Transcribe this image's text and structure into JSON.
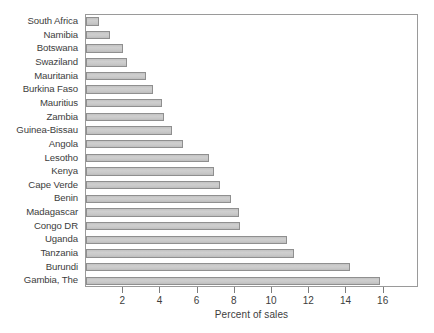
{
  "chart_data": {
    "type": "bar",
    "orientation": "horizontal",
    "title": "",
    "xlabel": "Percent of sales",
    "ylabel": "",
    "xlim": [
      0,
      17.9
    ],
    "xticks": [
      2,
      4,
      6,
      8,
      10,
      12,
      14,
      16
    ],
    "grid": false,
    "legend": null,
    "categories": [
      "South Africa",
      "Namibia",
      "Botswana",
      "Swaziland",
      "Mauritania",
      "Burkina Faso",
      "Mauritius",
      "Zambia",
      "Guinea-Bissau",
      "Angola",
      "Lesotho",
      "Kenya",
      "Cape Verde",
      "Benin",
      "Madagascar",
      "Congo DR",
      "Uganda",
      "Tanzania",
      "Burundi",
      "Gambia, The"
    ],
    "values": [
      0.7,
      1.3,
      2.0,
      2.2,
      3.2,
      3.6,
      4.1,
      4.2,
      4.6,
      5.2,
      6.6,
      6.9,
      7.2,
      7.8,
      8.2,
      8.3,
      10.8,
      11.2,
      14.2,
      15.8
    ]
  },
  "style": {
    "bar_fill": "#c9c9c9",
    "bar_border": "#8f8f8f",
    "frame_color": "#9a9a9a",
    "text_color": "#3d3d3d",
    "background": "#ffffff"
  }
}
